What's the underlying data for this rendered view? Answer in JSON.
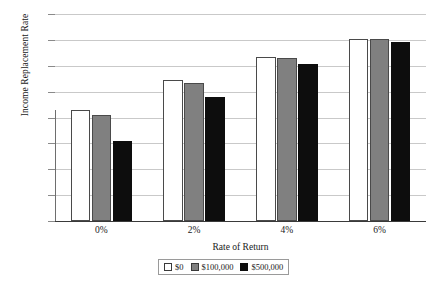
{
  "chart_data": {
    "type": "bar",
    "title": "",
    "xlabel": "Rate of Return",
    "ylabel": "Income Replacement Rate",
    "categories": [
      "0%",
      "2%",
      "4%",
      "6%"
    ],
    "series": [
      {
        "name": "$0",
        "color": "#ffffff",
        "values": [
          43.0,
          54.5,
          63.5,
          70.5
        ]
      },
      {
        "name": "$100,000",
        "color": "#808080",
        "values": [
          41.0,
          53.5,
          63.0,
          70.5
        ]
      },
      {
        "name": "$500,000",
        "color": "#0d0d0d",
        "values": [
          31.0,
          48.0,
          60.5,
          69.0
        ]
      }
    ],
    "ylim": [
      0,
      80
    ],
    "ytick_labels": [
      "80%",
      "70%",
      "60%",
      "50%",
      "40%",
      "30%",
      "20%",
      "10%",
      "0%"
    ],
    "ytick_values": [
      80,
      70,
      60,
      50,
      40,
      30,
      20,
      10,
      0
    ],
    "grid": true,
    "legend_position": "bottom-right"
  },
  "legend": {
    "items": [
      {
        "label": "$0"
      },
      {
        "label": "$100,000"
      },
      {
        "label": "$500,000"
      }
    ]
  }
}
